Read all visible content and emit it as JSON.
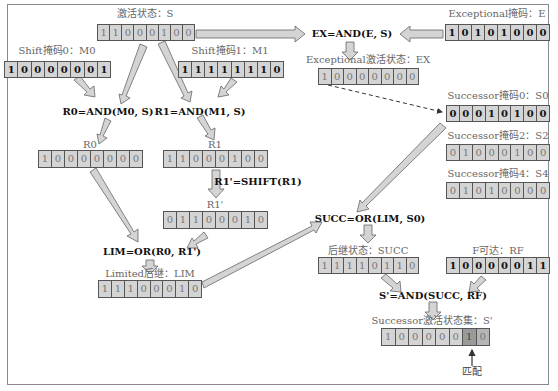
{
  "registers": {
    "S": {
      "label": "激活状态：S",
      "bits": [
        "1",
        "1",
        "0",
        "0",
        "0",
        "1",
        "0",
        "0"
      ]
    },
    "M0": {
      "label": "Shift掩码0：M0",
      "bits": [
        "1",
        "0",
        "0",
        "0",
        "0",
        "0",
        "0",
        "1"
      ]
    },
    "M1": {
      "label": "Shift掩码1：M1",
      "bits": [
        "1",
        "1",
        "1",
        "1",
        "1",
        "1",
        "1",
        "0"
      ]
    },
    "E": {
      "label": "Exceptional掩码：E",
      "bits": [
        "1",
        "0",
        "1",
        "0",
        "1",
        "0",
        "0",
        "0"
      ]
    },
    "EX": {
      "label": "Exceptional激活状态：EX",
      "bits": [
        "1",
        "0",
        "0",
        "0",
        "0",
        "0",
        "0",
        "0"
      ]
    },
    "S0": {
      "label": "Successor掩码0：S0",
      "bits": [
        "0",
        "0",
        "0",
        "1",
        "0",
        "1",
        "0",
        "0"
      ]
    },
    "S2": {
      "label": "Successor掩码2：S2",
      "bits": [
        "0",
        "1",
        "0",
        "0",
        "0",
        "1",
        "0",
        "0"
      ]
    },
    "S4": {
      "label": "Successor掩码4：S4",
      "bits": [
        "0",
        "1",
        "0",
        "1",
        "0",
        "0",
        "0",
        "0"
      ]
    },
    "R0": {
      "label": "R0",
      "bits": [
        "1",
        "0",
        "0",
        "0",
        "0",
        "0",
        "0",
        "0"
      ]
    },
    "R1": {
      "label": "R1",
      "bits": [
        "1",
        "1",
        "0",
        "0",
        "0",
        "1",
        "0",
        "0"
      ]
    },
    "R1p": {
      "label": "R1'",
      "bits": [
        "0",
        "1",
        "1",
        "0",
        "0",
        "0",
        "1",
        "0"
      ]
    },
    "LIM": {
      "label": "Limited后继：LIM",
      "bits": [
        "1",
        "1",
        "1",
        "0",
        "0",
        "0",
        "1",
        "0"
      ]
    },
    "SUCC": {
      "label": "后继状态：SUCC",
      "bits": [
        "1",
        "1",
        "1",
        "1",
        "0",
        "1",
        "1",
        "0"
      ]
    },
    "RF": {
      "label": "F可达：RF",
      "bits": [
        "1",
        "0",
        "0",
        "0",
        "0",
        "0",
        "1",
        "1"
      ]
    },
    "Sp": {
      "label": "Successor激活状态集：S'",
      "bits": [
        "1",
        "0",
        "0",
        "0",
        "0",
        "0",
        "1",
        "0"
      ]
    }
  },
  "equations": {
    "ex": "EX=AND(E, S)",
    "r0": "R0=AND(M0, S)",
    "r1": "R1=AND(M1, S)",
    "r1p": "R1'=SHIFT(R1)",
    "lim": "LIM=OR(R0, R1')",
    "succ": "SUCC=OR(LIM, S0)",
    "sp": "S'=AND(SUCC, RF)"
  },
  "annotations": {
    "match": "匹配"
  },
  "colors": {
    "cell_fill": "#d4d4d4",
    "arrow_fill": "#d0d0d0",
    "arrow_stroke": "#666666",
    "highlight": "#9a9a9a"
  }
}
